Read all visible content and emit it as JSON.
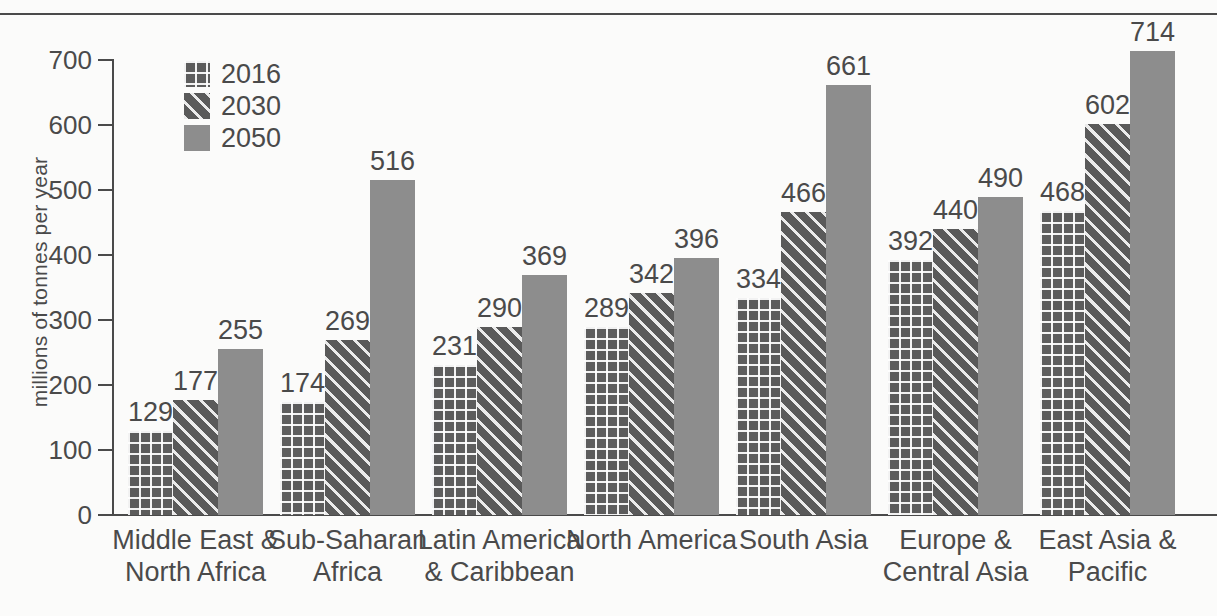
{
  "chart_data": {
    "type": "bar",
    "title": "",
    "subtitle": "",
    "xlabel": "",
    "ylabel": "millions of tonnes per year",
    "ylim": [
      0,
      700
    ],
    "ytick_step": 100,
    "yticks": [
      "700",
      "600",
      "500",
      "400",
      "300",
      "200",
      "100",
      "0"
    ],
    "grid": false,
    "legend_position": "top-left",
    "categories": [
      "Middle East &\nNorth Africa",
      "Sub-Saharan\nAfrica",
      "Latin America\n& Caribbean",
      "North America",
      "South Asia",
      "Europe &\nCentral Asia",
      "East Asia &\nPacific"
    ],
    "series": [
      {
        "name": "2016",
        "pattern": "grid",
        "color": "#5c5c5c",
        "values": [
          129,
          174,
          231,
          289,
          334,
          392,
          468
        ]
      },
      {
        "name": "2030",
        "pattern": "diagonal",
        "color": "#5a5a5a",
        "values": [
          177,
          269,
          290,
          342,
          466,
          440,
          602
        ]
      },
      {
        "name": "2050",
        "pattern": "solid",
        "color": "#8d8d8d",
        "values": [
          255,
          516,
          369,
          396,
          661,
          490,
          714
        ]
      }
    ]
  },
  "legend": {
    "items": [
      {
        "label": "2016",
        "pattern": "grid"
      },
      {
        "label": "2030",
        "pattern": "diagonal"
      },
      {
        "label": "2050",
        "pattern": "solid"
      }
    ]
  },
  "colors": {
    "background": "#fbfbfa",
    "axis": "#4a4a4a",
    "text": "#4a4a4a",
    "series_2016": "#5c5c5c",
    "series_2030": "#5a5a5a",
    "series_2050": "#8d8d8d"
  }
}
